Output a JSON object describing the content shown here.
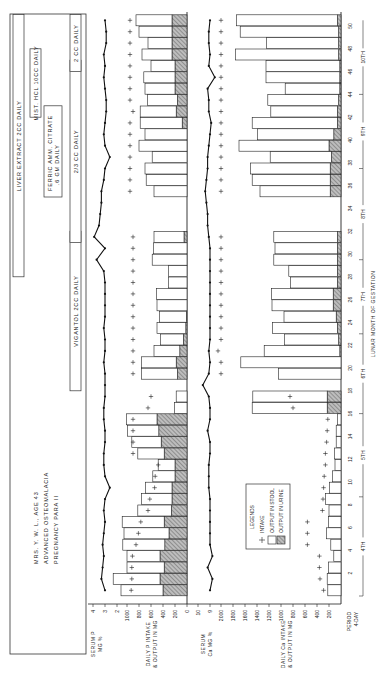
{
  "chart_data": {
    "type": "bar",
    "patient": {
      "line1": "MRS. Y. W. L., AGE 43",
      "line2": "ADVANCED OSTEOMALACIA",
      "line3": "PREGNANCY PARA II"
    },
    "xlabel": "LUNAR MONTH OF GESTATION",
    "period_label": [
      "PERIOD",
      "4-DAY"
    ],
    "period_ticks": [
      "2",
      "4",
      "6",
      "8",
      "10",
      "12",
      "14",
      "16",
      "18",
      "20",
      "22",
      "24",
      "26",
      "28",
      "30",
      "32",
      "34",
      "36",
      "38",
      "40",
      "42",
      "44",
      "46",
      "48",
      "50"
    ],
    "months": [
      "4TH",
      "5TH",
      "6TH",
      "7TH",
      "8TH",
      "9TH",
      "10TH"
    ],
    "treatments": [
      {
        "label": "LIVER EXTRACT 2CC DAILY",
        "from": 29,
        "to": 51
      },
      {
        "label": "MIST. HCL 10CC DAILY",
        "from": 43,
        "to": 48
      },
      {
        "label": "FERRIC AMM. CITRATE .6 GM DAILY",
        "from": 36,
        "to": 43
      },
      {
        "label": "VIGANTOL 2CC DAILY",
        "from": 19,
        "to": 32
      },
      {
        "label": "2/3 CC DAILY",
        "from": 32,
        "to": 47
      },
      {
        "label": "2 CC DAILY",
        "from": 47,
        "to": 51
      }
    ],
    "legend": {
      "title": "LEGENDS",
      "items": [
        "INTAKE",
        "OUTPUT IN STOOL",
        "OUTPUT IN URINE"
      ]
    },
    "panels": [
      {
        "name": "serum_p",
        "ylabel": "SERUM P MG %",
        "ticks": [
          "4",
          "3",
          "2"
        ]
      },
      {
        "name": "p_balance",
        "ylabel": "DAILY P INTAKE & OUTPUT IN MG",
        "ticks": [
          "1000",
          "800",
          "600",
          "400",
          "200",
          "0"
        ]
      },
      {
        "name": "serum_ca",
        "ylabel": "SERUM Ca MG %",
        "ticks": [
          "10",
          "9"
        ]
      },
      {
        "name": "ca_balance",
        "ylabel": "DAILY Ca INTAKE & OUTPUT IN MG",
        "ticks": [
          "2000",
          "1800",
          "1600",
          "1400",
          "1200",
          "1000",
          "800",
          "600",
          "400",
          "200"
        ]
      }
    ],
    "series": [
      {
        "name": "serum_p",
        "periods": [
          1,
          2,
          3,
          4,
          5,
          6,
          7,
          8,
          9,
          10,
          11,
          12,
          13,
          14,
          15,
          16,
          17,
          18,
          19,
          20,
          21,
          22,
          23,
          24,
          25,
          26,
          27,
          28,
          29,
          30,
          31,
          32,
          33,
          34,
          35,
          36,
          37,
          38,
          39,
          40,
          41,
          42,
          43,
          44,
          45,
          46,
          47,
          48,
          49,
          50,
          51
        ],
        "values": [
          3.0,
          3.3,
          3.2,
          3.1,
          3.2,
          3.1,
          3.0,
          3.1,
          3.0,
          2.6,
          3.0,
          3.1,
          3.1,
          3.0,
          3.0,
          3.1,
          3.1,
          3.0,
          3.0,
          3.0,
          3.1,
          3.0,
          3.0,
          3.1,
          3.0,
          3.0,
          3.0,
          3.0,
          3.1,
          3.7,
          3.0,
          3.9,
          3.5,
          3.4,
          3.3,
          3.3,
          3.1,
          3.0,
          2.6,
          3.0,
          3.1,
          3.0,
          2.9,
          2.9,
          3.0,
          3.1,
          3.0,
          3.1,
          2.9,
          2.9,
          3.0
        ]
      },
      {
        "name": "p_intake",
        "periods": [
          1,
          2,
          3,
          4,
          5,
          6,
          7,
          8,
          9,
          10,
          11,
          12,
          13,
          14,
          15,
          16,
          17,
          18,
          20,
          21,
          22,
          23,
          24,
          25,
          26,
          27,
          28,
          29,
          30,
          31,
          32,
          36,
          37,
          38,
          39,
          40,
          41,
          42,
          43,
          44,
          45,
          46,
          47,
          48,
          49,
          50,
          51
        ],
        "values": [
          930,
          920,
          920,
          910,
          850,
          810,
          770,
          650,
          620,
          540,
          530,
          480,
          900,
          900,
          900,
          900,
          650,
          600,
          900,
          900,
          900,
          900,
          900,
          900,
          900,
          900,
          900,
          900,
          900,
          900,
          900,
          950,
          950,
          950,
          950,
          950,
          950,
          950,
          900,
          950,
          950,
          950,
          950,
          950,
          950,
          950,
          950
        ]
      },
      {
        "name": "p_stool",
        "periods": [
          1,
          2,
          3,
          4,
          5,
          6,
          7,
          8,
          9,
          10,
          11,
          12,
          13,
          14,
          15,
          16,
          17,
          18,
          20,
          21,
          22,
          23,
          24,
          25,
          26,
          27,
          28,
          29,
          30,
          31,
          32,
          36,
          37,
          38,
          39,
          40,
          41,
          42,
          43,
          44,
          45,
          46,
          47,
          48,
          49,
          50,
          51
        ],
        "values": [
          700,
          780,
          620,
          550,
          700,
          750,
          700,
          560,
          510,
          440,
          370,
          280,
          440,
          490,
          520,
          510,
          210,
          180,
          600,
          580,
          430,
          380,
          480,
          450,
          500,
          510,
          310,
          310,
          580,
          560,
          500,
          550,
          680,
          700,
          580,
          800,
          700,
          700,
          600,
          500,
          500,
          520,
          400,
          500,
          400,
          550,
          600
        ]
      },
      {
        "name": "p_urine",
        "periods": [
          1,
          2,
          3,
          4,
          5,
          6,
          7,
          8,
          9,
          10,
          11,
          12,
          13,
          14,
          15,
          16,
          17,
          18,
          20,
          21,
          22,
          23,
          24,
          25,
          26,
          27,
          28,
          29,
          30,
          31,
          32,
          36,
          37,
          38,
          39,
          40,
          41,
          42,
          43,
          44,
          45,
          46,
          47,
          48,
          49,
          50,
          51
        ],
        "values": [
          400,
          450,
          380,
          450,
          370,
          300,
          380,
          260,
          250,
          250,
          200,
          200,
          380,
          430,
          470,
          500,
          0,
          0,
          160,
          180,
          120,
          60,
          20,
          10,
          0,
          0,
          0,
          0,
          0,
          0,
          50,
          0,
          0,
          0,
          0,
          0,
          0,
          80,
          180,
          160,
          200,
          200,
          200,
          250,
          250,
          250,
          250
        ]
      },
      {
        "name": "serum_ca",
        "periods": [
          1,
          2,
          3,
          4,
          5,
          6,
          7,
          8,
          9,
          10,
          11,
          12,
          13,
          14,
          15,
          16,
          17,
          18,
          19,
          20,
          21,
          22,
          23,
          24,
          25,
          26,
          27,
          28,
          29,
          30,
          31,
          32,
          33,
          34,
          35,
          36,
          37,
          38,
          39,
          40,
          41,
          42,
          43,
          44,
          45,
          46,
          47,
          48,
          49,
          50,
          51
        ],
        "values": [
          9.0,
          8.8,
          9.2,
          8.8,
          9.0,
          9.0,
          9.0,
          9.0,
          9.0,
          9.1,
          9.1,
          9.1,
          9.0,
          9.0,
          9.2,
          9.0,
          9.0,
          9.1,
          9.6,
          9.1,
          9.0,
          9.1,
          9.0,
          9.0,
          9.0,
          9.0,
          9.0,
          9.0,
          9.0,
          9.0,
          9.0,
          9.1,
          9.2,
          9.2,
          9.3,
          9.4,
          9.3,
          9.2,
          9.2,
          9.1,
          9.0,
          8.9,
          9.1,
          9.1,
          9.2,
          8.6,
          9.1,
          9.0,
          9.1,
          9.1,
          9.0
        ]
      },
      {
        "name": "ca_intake",
        "periods": [
          1,
          2,
          3,
          4,
          5,
          6,
          7,
          8,
          9,
          10,
          11,
          12,
          13,
          14,
          15,
          16,
          17,
          18,
          20,
          21,
          22,
          23,
          24,
          25,
          26,
          27,
          28,
          29,
          30,
          31,
          32,
          36,
          37,
          38,
          39,
          40,
          41,
          42,
          43,
          44,
          45,
          46,
          47,
          48,
          49,
          50,
          51
        ],
        "values": [
          290,
          350,
          360,
          360,
          560,
          560,
          560,
          310,
          300,
          290,
          280,
          260,
          260,
          240,
          230,
          220,
          800,
          850,
          2000,
          2000,
          2050,
          2000,
          2000,
          2000,
          2000,
          2000,
          2000,
          2000,
          2000,
          2000,
          2000,
          2000,
          2000,
          2000,
          2000,
          2000,
          2000,
          2000,
          2000,
          2000,
          2000,
          2000,
          2000,
          2000,
          2000,
          2000,
          2000
        ]
      },
      {
        "name": "ca_stool",
        "periods": [
          1,
          2,
          3,
          4,
          5,
          6,
          7,
          8,
          9,
          10,
          11,
          12,
          13,
          14,
          15,
          16,
          17,
          18,
          20,
          21,
          22,
          23,
          24,
          25,
          26,
          27,
          28,
          29,
          30,
          31,
          32,
          36,
          37,
          38,
          39,
          40,
          41,
          42,
          43,
          44,
          45,
          46,
          47,
          48,
          49,
          50,
          51
        ],
        "values": [
          220,
          230,
          210,
          120,
          170,
          240,
          210,
          200,
          260,
          190,
          140,
          100,
          110,
          80,
          80,
          60,
          1250,
          1240,
          1040,
          1670,
          1260,
          900,
          1080,
          870,
          1020,
          1030,
          780,
          810,
          1060,
          1040,
          1060,
          1170,
          1300,
          1330,
          1020,
          1500,
          1270,
          1420,
          1110,
          1180,
          910,
          1230,
          1230,
          1720,
          1200,
          1640,
          1680
        ]
      },
      {
        "name": "ca_urine",
        "periods": [
          1,
          2,
          3,
          4,
          5,
          6,
          7,
          8,
          9,
          10,
          11,
          12,
          13,
          14,
          15,
          16,
          17,
          18,
          20,
          21,
          22,
          23,
          24,
          25,
          26,
          27,
          28,
          29,
          30,
          31,
          32,
          36,
          37,
          38,
          39,
          40,
          41,
          42,
          43,
          44,
          45,
          46,
          47,
          48,
          49,
          50,
          51
        ],
        "values": [
          0,
          0,
          0,
          0,
          0,
          0,
          0,
          0,
          0,
          0,
          0,
          0,
          0,
          0,
          0,
          0,
          230,
          230,
          0,
          0,
          20,
          40,
          60,
          80,
          130,
          130,
          60,
          60,
          60,
          60,
          60,
          180,
          180,
          180,
          160,
          200,
          120,
          60,
          60,
          40,
          20,
          20,
          20,
          40,
          40,
          40,
          60
        ]
      }
    ],
    "grid": false,
    "legend_position": "inside-bottom"
  }
}
